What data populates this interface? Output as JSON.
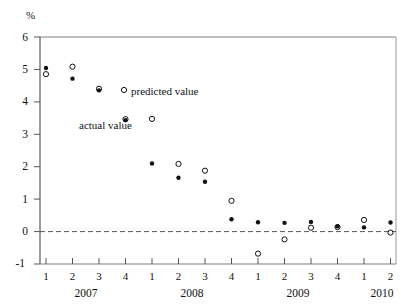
{
  "chart_data": {
    "type": "scatter",
    "title": "",
    "subtitle": "",
    "ylabel": "%",
    "xlabel": "",
    "ylim": [
      -1,
      6
    ],
    "y_ticks": [
      6,
      5,
      4,
      3,
      2,
      1,
      0,
      -1
    ],
    "y_tick_labels": [
      "6",
      "5",
      "4",
      "3",
      "2",
      "1",
      "0",
      "-1"
    ],
    "grid": false,
    "zero_line": true,
    "zero_line_style": "dashed",
    "legend_position": "inside-upper-middle",
    "x_tick_labels": [
      "1",
      "2",
      "3",
      "4",
      "1",
      "2",
      "3",
      "4",
      "1",
      "2",
      "3",
      "4",
      "1",
      "2"
    ],
    "x_group_labels": [
      "2007",
      "2008",
      "2009",
      "2010"
    ],
    "categories": [
      "2007 Q1",
      "2007 Q2",
      "2007 Q3",
      "2007 Q4",
      "2008 Q1",
      "2008 Q2",
      "2008 Q3",
      "2008 Q4",
      "2009 Q1",
      "2009 Q2",
      "2009 Q3",
      "2009 Q4",
      "2010 Q1",
      "2010 Q2"
    ],
    "series": [
      {
        "name": "actual value",
        "marker": "filled-circle",
        "color": "#111111",
        "values": [
          5.05,
          4.72,
          4.36,
          3.44,
          2.1,
          1.66,
          1.54,
          0.38,
          0.29,
          0.27,
          0.3,
          0.16,
          0.13,
          0.28
        ]
      },
      {
        "name": "predicted value",
        "marker": "open-circle",
        "color": "#111111",
        "values": [
          4.86,
          5.09,
          4.41,
          3.47,
          3.48,
          2.09,
          1.88,
          0.95,
          -0.68,
          -0.24,
          0.12,
          0.14,
          0.36,
          -0.03
        ]
      }
    ],
    "annotations": [
      {
        "name": "predicted-value-legend",
        "text": "predicted value"
      },
      {
        "name": "actual-value-legend",
        "text": "actual value"
      }
    ]
  },
  "axes": {
    "y_unit": "%"
  }
}
